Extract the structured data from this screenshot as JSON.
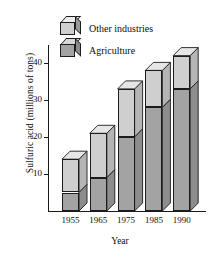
{
  "chart_data": {
    "type": "bar",
    "title": "",
    "subtitle": "",
    "xlabel": "Year",
    "ylabel": "Sulfuric acid (millions of tons)",
    "categories": [
      "1955",
      "1965",
      "1975",
      "1985",
      "1990"
    ],
    "ytick_labels": [
      "10",
      "20",
      "30",
      "40"
    ],
    "ytick_values": [
      10,
      20,
      30,
      40
    ],
    "ylim": [
      0,
      45
    ],
    "grid": false,
    "legend_position": "top-left",
    "stacked": true,
    "style": "3d-stacked-column",
    "series": [
      {
        "name": "Agriculture",
        "color": "#a3a3a3",
        "values": [
          5,
          9,
          20,
          28,
          33
        ]
      },
      {
        "name": "Other industries",
        "color": "#cfcfcf",
        "values": [
          9,
          12,
          13,
          10,
          9
        ]
      }
    ],
    "totals": [
      14,
      21,
      33,
      38,
      42
    ],
    "annotations": []
  },
  "legend": {
    "items": [
      {
        "label": "Other industries",
        "icon": "cube-icon-light"
      },
      {
        "label": "Agriculture",
        "icon": "cube-icon-dark"
      }
    ]
  },
  "colors": {
    "other_industries": "#cfcfcf",
    "agriculture": "#a3a3a3",
    "side_face": "#9a9a9a",
    "top_face": "#e2e2e2",
    "outline": "#1c1c1c",
    "background": "#ffffff",
    "text": "#0d0d0d"
  }
}
